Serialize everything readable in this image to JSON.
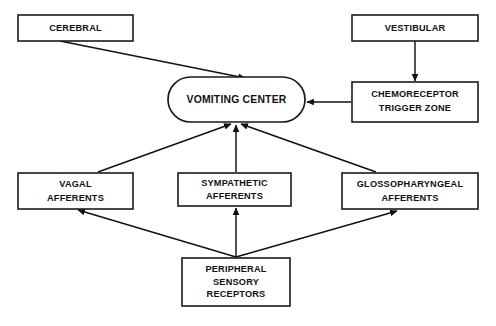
{
  "diagram": {
    "background_color": "#ffffff",
    "line_color": "#111111",
    "box_fill": "#ffffff",
    "nodes": [
      {
        "id": "cerebral",
        "shape": "rect",
        "lines": [
          "CEREBRAL"
        ],
        "x": 18,
        "y": 15,
        "w": 115,
        "h": 26
      },
      {
        "id": "vestibular",
        "shape": "rect",
        "lines": [
          "VESTIBULAR"
        ],
        "x": 352,
        "y": 15,
        "w": 126,
        "h": 26
      },
      {
        "id": "vomiting-center",
        "shape": "rounded",
        "lines": [
          "VOMITING CENTER"
        ],
        "x": 168,
        "y": 77,
        "w": 137,
        "h": 45
      },
      {
        "id": "chemoreceptor-trigger-zone",
        "shape": "rect",
        "lines": [
          "CHEMORECEPTOR",
          "TRIGGER ZONE"
        ],
        "x": 352,
        "y": 82,
        "w": 126,
        "h": 40
      },
      {
        "id": "vagal-afferents",
        "shape": "rect",
        "lines": [
          "VAGAL",
          "AFFERENTS"
        ],
        "x": 18,
        "y": 173,
        "w": 115,
        "h": 36
      },
      {
        "id": "sympathetic-afferents",
        "shape": "rect",
        "lines": [
          "SYMPATHETIC",
          "AFFERENTS"
        ],
        "x": 178,
        "y": 173,
        "w": 113,
        "h": 33
      },
      {
        "id": "glossopharyngeal-afferents",
        "shape": "rect",
        "lines": [
          "GLOSSOPHARYNGEAL",
          "AFFERENTS"
        ],
        "x": 342,
        "y": 173,
        "w": 136,
        "h": 36
      },
      {
        "id": "peripheral-sensory-receptors",
        "shape": "rect",
        "lines": [
          "PERIPHERAL",
          "SENSORY",
          "RECEPTORS"
        ],
        "x": 182,
        "y": 258,
        "w": 108,
        "h": 48
      }
    ],
    "edges": [
      {
        "id": "cerebral-to-vomiting-center",
        "from": "cerebral",
        "to": "vomiting-center",
        "points": "60,41 245,78",
        "arrow": true
      },
      {
        "id": "vestibular-to-ctz",
        "from": "vestibular",
        "to": "chemoreceptor-trigger-zone",
        "points": "415,41 415,81",
        "arrow": true
      },
      {
        "id": "ctz-to-vomiting-center",
        "from": "chemoreceptor-trigger-zone",
        "to": "vomiting-center",
        "points": "351,102 307,102",
        "arrow": true
      },
      {
        "id": "vagal-to-vomiting-center",
        "from": "vagal-afferents",
        "to": "vomiting-center",
        "points": "98,172 231,124",
        "arrow": true
      },
      {
        "id": "sympathetic-to-vomiting-center",
        "from": "sympathetic-afferents",
        "to": "vomiting-center",
        "points": "236,172 236,125",
        "arrow": true
      },
      {
        "id": "glossopharyngeal-to-vomiting-center",
        "from": "glossopharyngeal-afferents",
        "to": "vomiting-center",
        "points": "376,172 241,124",
        "arrow": true
      },
      {
        "id": "peripheral-to-vagal",
        "from": "peripheral-sensory-receptors",
        "to": "vagal-afferents",
        "points": "236,257 78,210",
        "arrow": true
      },
      {
        "id": "peripheral-to-sympathetic",
        "from": "peripheral-sensory-receptors",
        "to": "sympathetic-afferents",
        "points": "236,257 236,208",
        "arrow": true
      },
      {
        "id": "peripheral-to-glossopharyngeal",
        "from": "peripheral-sensory-receptors",
        "to": "glossopharyngeal-afferents",
        "points": "236,257 397,211",
        "arrow": true
      }
    ]
  }
}
